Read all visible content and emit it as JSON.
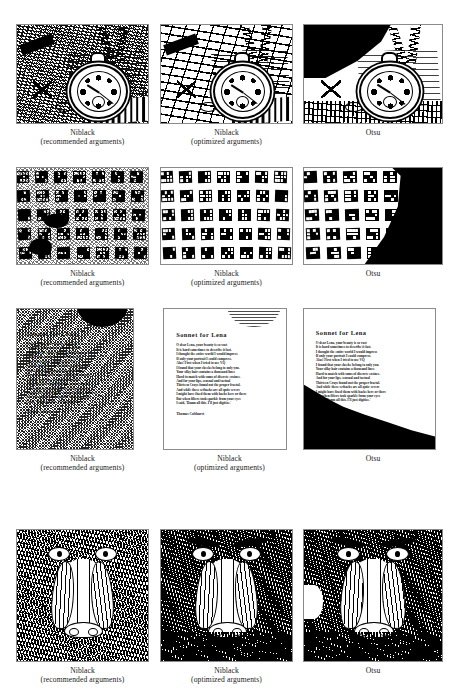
{
  "figure": {
    "kind": "image-binarization-comparison",
    "columns": [
      {
        "key": "niblack_recommended",
        "label_line1": "Niblack",
        "label_line2": "(recommended arguments)"
      },
      {
        "key": "niblack_optimized",
        "label_line1": "Niblack",
        "label_line2": "(optimized arguments)"
      },
      {
        "key": "otsu",
        "label_line1": "Otsu",
        "label_line2": ""
      }
    ],
    "rows": [
      {
        "key": "pocketwatch",
        "subject": "pocket watch on newspaper"
      },
      {
        "key": "markers",
        "subject": "grid of fiducial markers"
      },
      {
        "key": "sonnet",
        "subject": "printed sonnet page"
      },
      {
        "key": "mandrill",
        "subject": "mandrill face"
      }
    ]
  },
  "captions": {
    "niblack": "Niblack",
    "recommended": "(recommended arguments)",
    "optimized": "(optimized arguments)",
    "otsu": "Otsu"
  },
  "sonnet": {
    "title": "Sonnet for Lena",
    "lines": [
      "O dear Lena, your beauty is so vast",
      "It is hard sometimes to describe it fast.",
      "I thought the entire world I would impress",
      "If only your portrait I could compress.",
      "Alas! First when I tried to use VQ",
      "I found that your cheeks belong to only you.",
      "Your silky hair contains a thousand lines",
      "Hard to match with sums of discrete cosines.",
      "And for your lips, sensual and tactual",
      "Thirteen Crays found not the proper fractal.",
      "And while these setbacks are all quite severe",
      "I might have fixed them with hacks here or there",
      "But when filters took sparkle from your eyes",
      "I said, 'Damn all this. I'll just digitize.'"
    ],
    "signature": "Thomas Colthurst"
  },
  "colors": {
    "page_background": "#ffffff",
    "ink": "#000000",
    "caption_text": "#1a1a1a",
    "panel_border": "#8a8a8a"
  }
}
